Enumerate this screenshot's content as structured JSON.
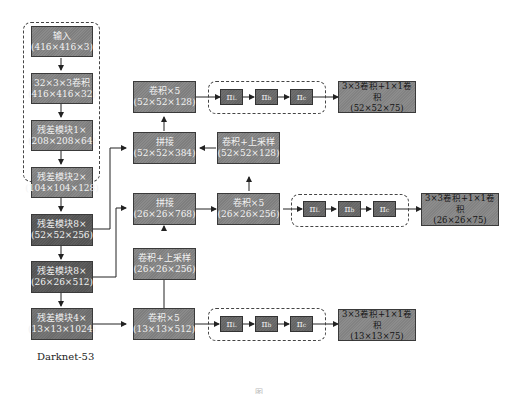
{
  "backbone": {
    "label": "Darknet-53",
    "blocks": [
      {
        "title": "输入",
        "shape": "(416×416×3)"
      },
      {
        "title": "32×3×3卷积",
        "shape": "(416×416×32)"
      },
      {
        "title": "残差模块1×",
        "shape": "(208×208×64)"
      },
      {
        "title": "残差模块2×",
        "shape": "(104×104×128)"
      },
      {
        "title": "残差模块8×",
        "shape": "(52×52×256)"
      },
      {
        "title": "残差模块8×",
        "shape": "(26×26×512)"
      },
      {
        "title": "残差模块4×",
        "shape": "(13×13×1024)"
      }
    ]
  },
  "neck": {
    "scale52": {
      "conv5": {
        "title": "卷积×5",
        "shape": "(52×52×128)"
      },
      "concat": {
        "title": "拼接",
        "shape": "(52×52×384)"
      },
      "upsample": {
        "title": "卷积+上采样",
        "shape": "(52×52×128)"
      }
    },
    "scale26": {
      "concat": {
        "title": "拼接",
        "shape": "(26×26×768)"
      },
      "conv5": {
        "title": "卷积×5",
        "shape": "(26×26×256)"
      },
      "upsample": {
        "title": "卷积+上采样",
        "shape": "(26×26×256)"
      }
    },
    "scale13": {
      "conv5": {
        "title": "卷积×5",
        "shape": "(13×13×512)"
      }
    }
  },
  "pi_modules": {
    "symbol": "π",
    "subscripts": [
      "L",
      "b",
      "c"
    ]
  },
  "heads": [
    {
      "title": "3×3卷积+1×1卷积",
      "shape": "(52×52×75)"
    },
    {
      "title": "3×3卷积+1×1卷积",
      "shape": "(26×26×75)"
    },
    {
      "title": "3×3卷积+1×1卷积",
      "shape": "(13×13×75)"
    }
  ],
  "caption": "图"
}
